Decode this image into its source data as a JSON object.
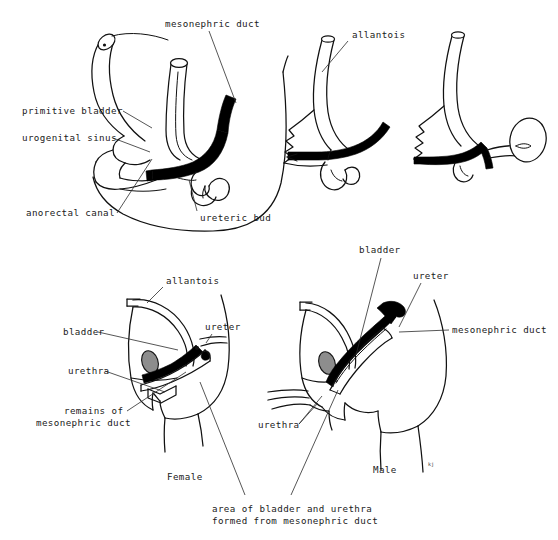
{
  "figure": {
    "background_color": "#ffffff",
    "ink_color": "#111111",
    "duct_fill_color": "#000000",
    "gonad_fill_color": "#8d8d8d"
  },
  "panels": {
    "top_left": {
      "name": "early-embryo-panel",
      "labels": [
        {
          "id": "mesonephric-duct",
          "text": "mesonephric duct"
        },
        {
          "id": "primitive-bladder",
          "text": "primitive bladder"
        },
        {
          "id": "urogenital-sinus",
          "text": "urogenital sinus"
        },
        {
          "id": "anorectal-canal",
          "text": "anorectal canal"
        },
        {
          "id": "ureteric-bud",
          "text": "ureteric bud"
        }
      ]
    },
    "top_middle": {
      "name": "intermediate-stage-panel",
      "labels": [
        {
          "id": "allantois",
          "text": "allantois"
        }
      ]
    },
    "top_right": {
      "name": "later-stage-panel",
      "labels": []
    },
    "bottom_left": {
      "name": "female-panel",
      "caption": "Female",
      "labels": [
        {
          "id": "allantois",
          "text": "allantois"
        },
        {
          "id": "bladder",
          "text": "bladder"
        },
        {
          "id": "ureter",
          "text": "ureter"
        },
        {
          "id": "urethra",
          "text": "urethra"
        },
        {
          "id": "remains-of-mesonephric-duct-line1",
          "text": "remains of"
        },
        {
          "id": "remains-of-mesonephric-duct-line2",
          "text": "mesonephric duct"
        }
      ]
    },
    "bottom_right": {
      "name": "male-panel",
      "caption": "Male",
      "signature": "kj",
      "labels": [
        {
          "id": "bladder",
          "text": "bladder"
        },
        {
          "id": "ureter",
          "text": "ureter"
        },
        {
          "id": "mesonephric-duct",
          "text": "mesonephric duct"
        },
        {
          "id": "urethra",
          "text": "urethra"
        }
      ]
    }
  },
  "bottom_caption": {
    "line1": "area of bladder and urethra",
    "line2": "formed from mesonephric duct"
  }
}
